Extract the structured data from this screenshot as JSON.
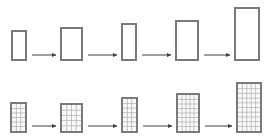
{
  "canvas": {
    "width": 270,
    "height": 138,
    "background": "#ffffff"
  },
  "style": {
    "rect_stroke": "#7a7a7a",
    "rect_stroke_width": 2,
    "rect_fill": "#ffffff",
    "grid_line_color": "#b4b4b4",
    "grid_line_width": 0.8,
    "grid_fill": "#fafafa",
    "arrow_color": "#3f3f3f",
    "arrow_width": 1
  },
  "rows": [
    {
      "id": "row-plain",
      "name": "plain-rectangle-sequence",
      "gridded": false,
      "baseline_y": 61,
      "shapes": [
        {
          "name": "rectangle-1",
          "x": 11,
          "y": 30,
          "w": 16,
          "h": 31,
          "cols": 0,
          "rows": 0
        },
        {
          "name": "rectangle-2",
          "x": 60,
          "y": 27,
          "w": 23,
          "h": 34,
          "cols": 0,
          "rows": 0
        },
        {
          "name": "rectangle-3",
          "x": 121,
          "y": 23,
          "w": 16,
          "h": 38,
          "cols": 0,
          "rows": 0
        },
        {
          "name": "rectangle-4",
          "x": 175,
          "y": 20,
          "w": 24,
          "h": 41,
          "cols": 0,
          "rows": 0
        },
        {
          "name": "rectangle-5",
          "x": 234,
          "y": 7,
          "w": 26,
          "h": 54,
          "cols": 0,
          "rows": 0
        }
      ],
      "arrows": [
        {
          "name": "arrow-1-to-2",
          "x1": 32,
          "x2": 56,
          "y": 55
        },
        {
          "name": "arrow-2-to-3",
          "x1": 88,
          "x2": 117,
          "y": 55
        },
        {
          "name": "arrow-3-to-4",
          "x1": 142,
          "x2": 171,
          "y": 55
        },
        {
          "name": "arrow-4-to-5",
          "x1": 204,
          "x2": 230,
          "y": 55
        }
      ]
    },
    {
      "id": "row-gridded",
      "name": "gridded-rectangle-sequence",
      "gridded": true,
      "baseline_y": 133,
      "shapes": [
        {
          "name": "grid-rectangle-1",
          "x": 10,
          "y": 102,
          "w": 17,
          "h": 31,
          "cols": 3,
          "rows": 6
        },
        {
          "name": "grid-rectangle-2",
          "x": 60,
          "y": 103,
          "w": 23,
          "h": 30,
          "cols": 4,
          "rows": 5
        },
        {
          "name": "grid-rectangle-3",
          "x": 121,
          "y": 97,
          "w": 17,
          "h": 36,
          "cols": 3,
          "rows": 7
        },
        {
          "name": "grid-rectangle-4",
          "x": 176,
          "y": 93,
          "w": 24,
          "h": 40,
          "cols": 5,
          "rows": 8
        },
        {
          "name": "grid-rectangle-5",
          "x": 236,
          "y": 82,
          "w": 26,
          "h": 51,
          "cols": 5,
          "rows": 10
        }
      ],
      "arrows": [
        {
          "name": "grid-arrow-1-to-2",
          "x1": 32,
          "x2": 56,
          "y": 126
        },
        {
          "name": "grid-arrow-2-to-3",
          "x1": 88,
          "x2": 117,
          "y": 126
        },
        {
          "name": "grid-arrow-3-to-4",
          "x1": 143,
          "x2": 172,
          "y": 126
        },
        {
          "name": "grid-arrow-4-to-5",
          "x1": 205,
          "x2": 232,
          "y": 126
        }
      ]
    }
  ]
}
